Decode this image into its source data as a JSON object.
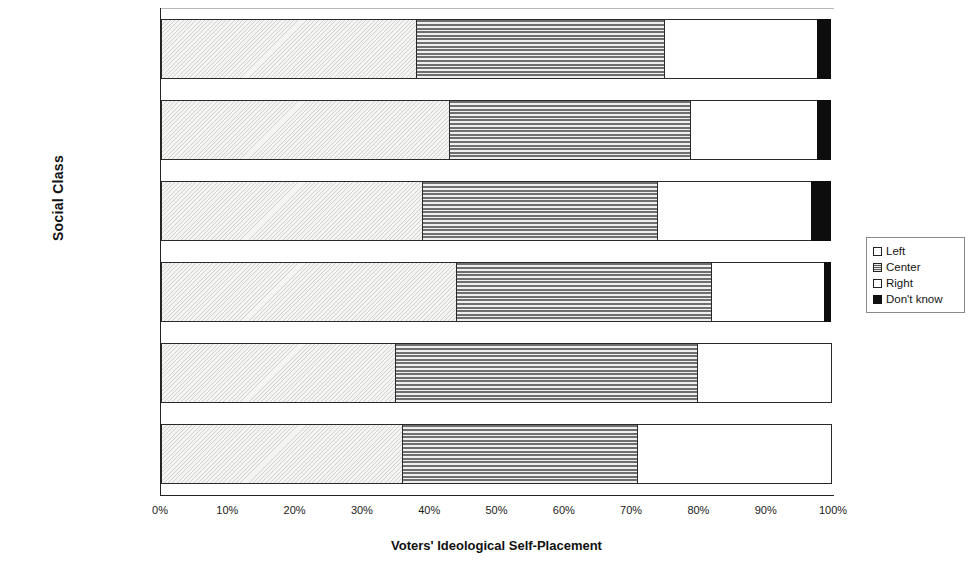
{
  "chart_data": {
    "type": "bar",
    "orientation": "horizontal",
    "stacked": true,
    "normalized_percent": true,
    "title": "",
    "xlabel": "Voters' Ideological Self-Placement",
    "ylabel": "Social Class",
    "xlim": [
      0,
      100
    ],
    "xtick_labels": [
      "0%",
      "10%",
      "20%",
      "30%",
      "40%",
      "50%",
      "60%",
      "70%",
      "80%",
      "90%",
      "100%"
    ],
    "xtick_values": [
      0,
      10,
      20,
      30,
      40,
      50,
      60,
      70,
      80,
      90,
      100
    ],
    "grid": false,
    "legend_position": "right",
    "categories": [
      "All",
      "Unemployed",
      "Informal workers",
      "Formal workers",
      "Petty bourgeoisie",
      "Dominant"
    ],
    "series": [
      {
        "name": "Left",
        "values": [
          38,
          43,
          39,
          44,
          35,
          36
        ]
      },
      {
        "name": "Center",
        "values": [
          37,
          36,
          35,
          38,
          45,
          35
        ]
      },
      {
        "name": "Right",
        "values": [
          23,
          19,
          23,
          17,
          20,
          29
        ]
      },
      {
        "name": "Don't know",
        "values": [
          2,
          2,
          3,
          1,
          0,
          0
        ]
      }
    ],
    "patterns": {
      "Left": "light-diagonal-hatch",
      "Center": "horizontal-stripes-gray",
      "Right": "solid-white",
      "Don't know": "solid-black"
    }
  },
  "legend": {
    "items": [
      {
        "label": "Left",
        "key": "left-swatch"
      },
      {
        "label": "Center",
        "key": "center-swatch"
      },
      {
        "label": "Right",
        "key": "right-swatch"
      },
      {
        "label": "Don't know",
        "key": "dont-know-swatch"
      }
    ]
  }
}
